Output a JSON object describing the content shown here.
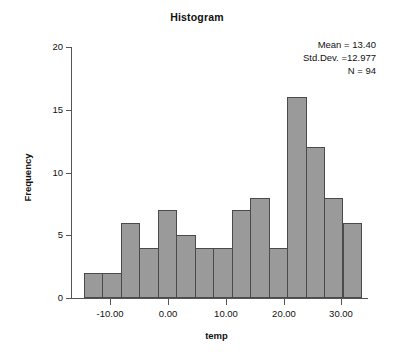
{
  "chart_data": {
    "type": "bar",
    "title": "Histogram",
    "xlabel": "temp",
    "ylabel": "Frequency",
    "xlim": [
      -16.6,
      33.4
    ],
    "ylim": [
      0,
      20
    ],
    "grid": false,
    "legend": "none",
    "y_ticks": [
      0,
      5,
      10,
      15,
      20
    ],
    "y_tick_labels": [
      "0",
      "5",
      "10",
      "15",
      "20"
    ],
    "x_ticks": [
      -10,
      0,
      10,
      20,
      30
    ],
    "x_tick_labels": [
      "-10.00",
      "0.00",
      "10.00",
      "20.00",
      "30.00"
    ],
    "bin_width": 3.2,
    "bin_edges": [
      -14.6,
      -11.4,
      -8.2,
      -5.0,
      -1.8,
      1.4,
      4.6,
      7.8,
      11.0,
      14.2,
      17.4,
      20.6,
      23.8,
      27.0,
      30.2,
      33.4
    ],
    "categories": [
      "-14.6 to -11.4",
      "-11.4 to -8.2",
      "-8.2 to -5.0",
      "-5.0 to -1.8",
      "-1.8 to 1.4",
      "1.4 to 4.6",
      "4.6 to 7.8",
      "7.8 to 11.0",
      "11.0 to 14.2",
      "14.2 to 17.4",
      "17.4 to 20.6",
      "20.6 to 23.8",
      "23.8 to 27.0",
      "27.0 to 30.2",
      "30.2 to 33.4"
    ],
    "values": [
      2,
      2,
      6,
      4,
      7,
      5,
      4,
      4,
      7,
      8,
      4,
      16,
      12,
      8,
      6
    ],
    "bar_color": "#9a9a9a",
    "bar_edge_color": "#4a4a4a",
    "annotations": {
      "mean_label": "Mean = 13.40",
      "std_label": "Std.Dev. =12.977",
      "n_label": "N = 94"
    }
  },
  "stats": {
    "mean": "Mean = 13.40",
    "std_dev": "Std.Dev. =12.977",
    "n": "N = 94"
  },
  "axes": {
    "x_title": "temp",
    "y_title": "Frequency"
  }
}
